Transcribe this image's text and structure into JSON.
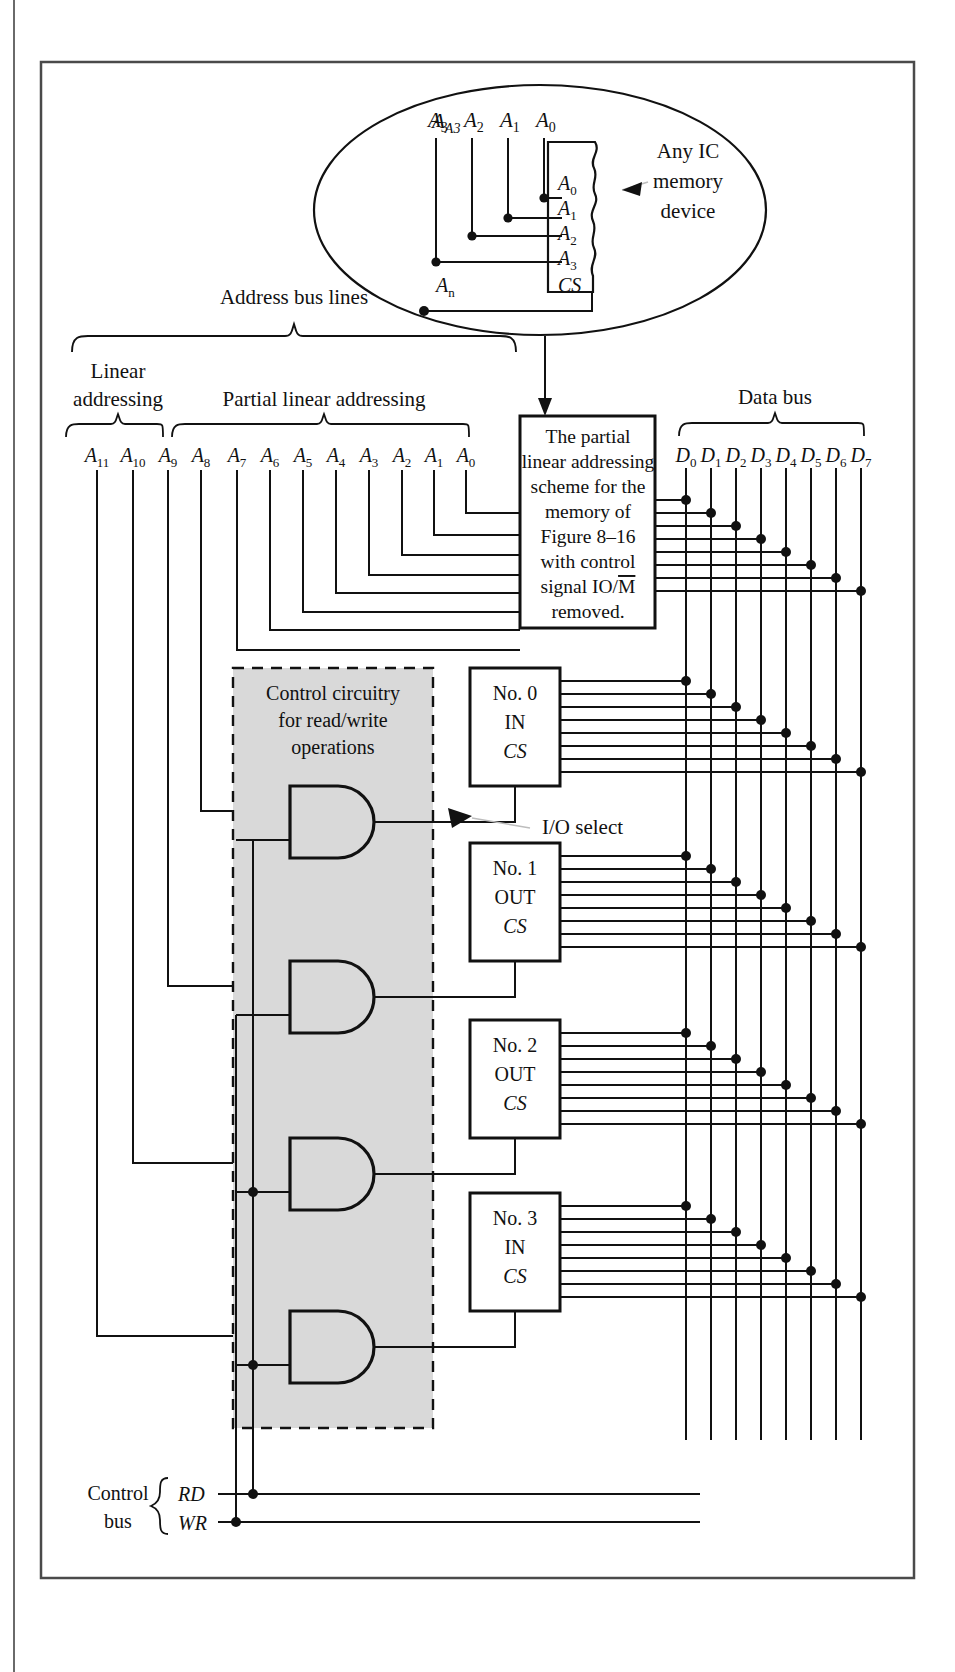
{
  "figure": {
    "domain": "technical-circuit-diagram"
  },
  "colors": {
    "ink": "#111111",
    "page": "#ffffff",
    "frame": "#555555",
    "shaded_region": "#d9d9d9",
    "dashed_border": "#000000"
  },
  "callout": {
    "bubble_labels": [
      "A3",
      "A2",
      "A1",
      "A0"
    ],
    "chip_pins": [
      "A0",
      "A1",
      "A2",
      "A3",
      "CS"
    ],
    "chip_cs_line": "An",
    "annotation_lines": [
      "Any IC",
      "memory",
      "device"
    ]
  },
  "address_bus": {
    "header": "Address bus lines",
    "groups": [
      {
        "label_lines": [
          "Linear",
          "addressing"
        ],
        "lines": [
          "A11",
          "A10",
          "A9",
          "A8"
        ]
      },
      {
        "label_lines": [
          "Partial linear addressing"
        ],
        "lines": [
          "A7",
          "A6",
          "A5",
          "A4",
          "A3",
          "A2",
          "A1",
          "A0"
        ]
      }
    ],
    "all_lines": [
      "A11",
      "A10",
      "A9",
      "A8",
      "A7",
      "A6",
      "A5",
      "A4",
      "A3",
      "A2",
      "A1",
      "A0"
    ]
  },
  "data_bus": {
    "header": "Data bus",
    "lines": [
      "D0",
      "D1",
      "D2",
      "D3",
      "D4",
      "D5",
      "D6",
      "D7"
    ]
  },
  "memory_box": {
    "text_lines": [
      "The partial",
      "linear addressing",
      "scheme for the",
      "memory of",
      "Figure 8–16",
      "with control",
      "signal IO/M",
      "removed."
    ],
    "overbar_on": "M"
  },
  "control_region": {
    "label_lines": [
      "Control circuitry",
      "for read/write",
      "operations"
    ],
    "gate_type": "AND",
    "gate_count": 4
  },
  "io_devices": [
    {
      "name": "No. 0",
      "direction": "IN",
      "select": "CS"
    },
    {
      "name": "No. 1",
      "direction": "OUT",
      "select": "CS"
    },
    {
      "name": "No. 2",
      "direction": "OUT",
      "select": "CS"
    },
    {
      "name": "No. 3",
      "direction": "IN",
      "select": "CS"
    }
  ],
  "annotations": {
    "io_select": "I/O select"
  },
  "control_bus": {
    "label_lines": [
      "Control",
      "bus"
    ],
    "signals": [
      "RD",
      "WR"
    ]
  }
}
